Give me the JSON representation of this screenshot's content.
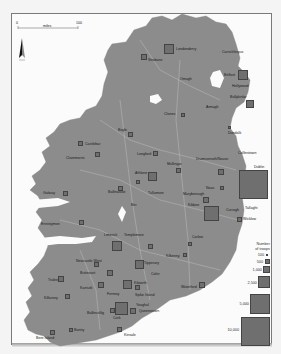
{
  "map": {
    "title": "",
    "scale_bar": {
      "start": "0",
      "end": "100",
      "unit": "miles"
    },
    "north_arrow": "N",
    "colors": {
      "land": "#8c8c8c",
      "water": "#ffffff",
      "border": "#c8c8c8",
      "symbol": "#6f6f6f"
    }
  },
  "places": [
    {
      "name": "Londonderry",
      "x": 176,
      "y": 48
    },
    {
      "name": "Carrickfergus",
      "x": 222,
      "y": 50
    },
    {
      "name": "Strabane",
      "x": 149,
      "y": 58
    },
    {
      "name": "Omagh",
      "x": 180,
      "y": 78
    },
    {
      "name": "Belfast",
      "x": 226,
      "y": 74
    },
    {
      "name": "Hollywood",
      "x": 232,
      "y": 84
    },
    {
      "name": "Ballykinlar",
      "x": 231,
      "y": 97
    },
    {
      "name": "Armagh",
      "x": 210,
      "y": 106
    },
    {
      "name": "Clones",
      "x": 169,
      "y": 110
    },
    {
      "name": "Dundalk",
      "x": 228,
      "y": 132
    },
    {
      "name": "Boyle",
      "x": 119,
      "y": 127
    },
    {
      "name": "Castlebar",
      "x": 73,
      "y": 141
    },
    {
      "name": "Longford",
      "x": 141,
      "y": 153
    },
    {
      "name": "Claremorris",
      "x": 66,
      "y": 155
    },
    {
      "name": "Drumconrath/Navan",
      "x": 198,
      "y": 157
    },
    {
      "name": "Collinstown",
      "x": 240,
      "y": 154
    },
    {
      "name": "Mullingar",
      "x": 170,
      "y": 163
    },
    {
      "name": "Athlone",
      "x": 138,
      "y": 171
    },
    {
      "name": "Dublin",
      "x": 255,
      "y": 165
    },
    {
      "name": "Galway",
      "x": 45,
      "y": 190
    },
    {
      "name": "Ballinasloe",
      "x": 110,
      "y": 190
    },
    {
      "name": "Tullamore",
      "x": 153,
      "y": 191
    },
    {
      "name": "Naas",
      "x": 207,
      "y": 186
    },
    {
      "name": "Maryborough",
      "x": 183,
      "y": 193
    },
    {
      "name": "Tallaght",
      "x": 245,
      "y": 207
    },
    {
      "name": "Kildare",
      "x": 190,
      "y": 203
    },
    {
      "name": "Curragh",
      "x": 229,
      "y": 209
    },
    {
      "name": "Birr",
      "x": 132,
      "y": 203
    },
    {
      "name": "Wicklow",
      "x": 237,
      "y": 217
    },
    {
      "name": "Ennistymon",
      "x": 43,
      "y": 223
    },
    {
      "name": "Limerick",
      "x": 100,
      "y": 233
    },
    {
      "name": "Templemore",
      "x": 130,
      "y": 233
    },
    {
      "name": "Carlow",
      "x": 202,
      "y": 237
    },
    {
      "name": "Kilkenny",
      "x": 187,
      "y": 248
    },
    {
      "name": "Newcastle West",
      "x": 80,
      "y": 261
    },
    {
      "name": "Tipperary",
      "x": 137,
      "y": 263
    },
    {
      "name": "Cahir",
      "x": 143,
      "y": 272
    },
    {
      "name": "Buttevant",
      "x": 84,
      "y": 272
    },
    {
      "name": "Tralee",
      "x": 52,
      "y": 279
    },
    {
      "name": "Kanturk",
      "x": 82,
      "y": 285
    },
    {
      "name": "Fermoy",
      "x": 113,
      "y": 291
    },
    {
      "name": "Kilworth",
      "x": 127,
      "y": 283
    },
    {
      "name": "Waterford",
      "x": 183,
      "y": 284
    },
    {
      "name": "Killarney",
      "x": 44,
      "y": 296
    },
    {
      "name": "Spike Island",
      "x": 128,
      "y": 297
    },
    {
      "name": "Ballincollig",
      "x": 87,
      "y": 311
    },
    {
      "name": "Cork",
      "x": 113,
      "y": 307
    },
    {
      "name": "Youghal",
      "x": 130,
      "y": 303
    },
    {
      "name": "Queenstown",
      "x": 132,
      "y": 323
    },
    {
      "name": "Bantry",
      "x": 77,
      "y": 330
    },
    {
      "name": "Kinsale",
      "x": 120,
      "y": 334
    },
    {
      "name": "Bere Island",
      "x": 42,
      "y": 336
    }
  ],
  "legend": {
    "title_line1": "Number",
    "title_line2": "of troops",
    "items": [
      {
        "label": "100",
        "size": 2
      },
      {
        "label": "500",
        "size": 5
      },
      {
        "label": "1,000",
        "size": 7
      },
      {
        "label": "2,500",
        "size": 12
      },
      {
        "label": "5,000",
        "size": 20
      },
      {
        "label": "10,000",
        "size": 29
      }
    ]
  }
}
